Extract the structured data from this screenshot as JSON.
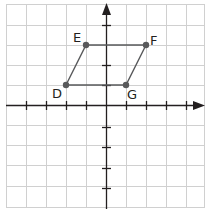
{
  "grid": {
    "x_min": -5,
    "x_max": 5,
    "y_min": -5,
    "y_max": 5,
    "cell_px": 20,
    "origin_px": [
      106,
      105
    ],
    "grid_color": "#d0d0d0",
    "axis_color": "#231f20"
  },
  "shape": {
    "type": "parallelogram",
    "stroke_color": "#58595b",
    "point_color": "#58595b",
    "vertices": [
      {
        "label": "D",
        "x": -2,
        "y": 1
      },
      {
        "label": "E",
        "x": -1,
        "y": 3
      },
      {
        "label": "F",
        "x": 2,
        "y": 3
      },
      {
        "label": "G",
        "x": 1,
        "y": 1
      }
    ]
  },
  "labels": {
    "D": "D",
    "E": "E",
    "F": "F",
    "G": "G"
  }
}
